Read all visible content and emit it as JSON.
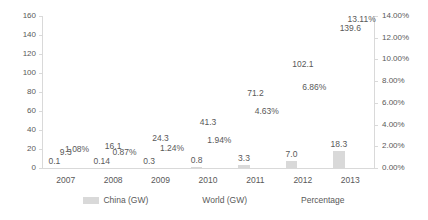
{
  "chart_data": {
    "type": "bar",
    "title": "",
    "xlabel": "",
    "ylabel": "",
    "categories": [
      "2007",
      "2008",
      "2009",
      "2010",
      "2011",
      "2012",
      "2013"
    ],
    "series": [
      {
        "name": "China (GW)",
        "axis": "left",
        "render": "bar",
        "color": "#d9d9d9",
        "values": [
          0.1,
          0.14,
          0.3,
          0.8,
          3.3,
          7.0,
          18.3
        ],
        "labels": [
          "0.1",
          "0.14",
          "0.3",
          "0.8",
          "3.3",
          "7.0",
          "18.3"
        ]
      },
      {
        "name": "World (GW)",
        "axis": "left",
        "render": "bar-hidden",
        "color": "#ffffff",
        "values": [
          9.3,
          16.1,
          24.3,
          41.3,
          71.2,
          102.1,
          139.6
        ],
        "labels": [
          "9.3",
          "16.1",
          "24.3",
          "41.3",
          "71.2",
          "102.1",
          "139.6"
        ]
      },
      {
        "name": "Percentage",
        "axis": "right",
        "render": "bar-hidden",
        "color": "#ffffff",
        "values": [
          1.08,
          0.87,
          1.24,
          1.94,
          4.63,
          6.86,
          13.11
        ],
        "labels": [
          "1.08%",
          "0.87%",
          "1.24%",
          "1.94%",
          "4.63%",
          "6.86%",
          "13.11%"
        ]
      }
    ],
    "left_axis": {
      "ticks": [
        "0",
        "20",
        "40",
        "60",
        "80",
        "100",
        "120",
        "140",
        "160"
      ],
      "ylim": [
        0,
        160
      ],
      "step": 20
    },
    "right_axis": {
      "ticks": [
        "0.00%",
        "2.00%",
        "4.00%",
        "6.00%",
        "8.00%",
        "10.00%",
        "12.00%",
        "14.00%"
      ],
      "ylim": [
        0,
        14
      ],
      "step": 2
    },
    "legend": {
      "position": "bottom",
      "entries": [
        {
          "label": "China (GW)",
          "color": "#d9d9d9"
        },
        {
          "label": "World (GW)",
          "color": "#ffffff"
        },
        {
          "label": "Percentage",
          "color": "#ffffff"
        }
      ]
    },
    "grid": false,
    "colors": {
      "bar": "#d9d9d9",
      "text": "#595959",
      "axis": "#d9d9d9",
      "background": "#ffffff"
    }
  }
}
